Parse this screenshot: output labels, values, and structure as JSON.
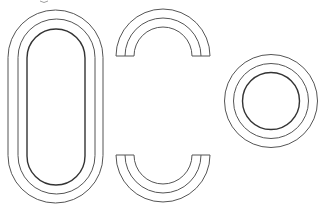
{
  "diagram": {
    "background": "#ffffff",
    "stroke_color": "#555555",
    "inner_stroke_color": "#333333",
    "shapes": [
      {
        "name": "stadium-rings",
        "type": "stadium",
        "rings": [
          {
            "x": 8,
            "y": 10,
            "w": 95,
            "h": 193
          },
          {
            "x": 18,
            "y": 19,
            "w": 77,
            "h": 175
          },
          {
            "x": 27,
            "y": 29,
            "w": 58,
            "h": 156
          }
        ]
      },
      {
        "name": "top-arch",
        "type": "arch-up",
        "cx": 163,
        "cy": 56,
        "radii": [
          47,
          38,
          29
        ]
      },
      {
        "name": "bottom-arch",
        "type": "arch-down",
        "cx": 163,
        "cy": 155,
        "radii": [
          47,
          38,
          29
        ]
      },
      {
        "name": "circle-rings",
        "type": "circle",
        "cx": 271,
        "cy": 101,
        "radii": [
          46.5,
          37.5,
          28.5
        ]
      }
    ]
  }
}
